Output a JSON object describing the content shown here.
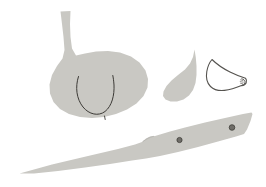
{
  "scene": {
    "title": "Garlic bulb, cloves and knife line drawing",
    "width": 266,
    "height": 187,
    "background_color": "#ffffff"
  },
  "palette": {
    "fill_gray": "#c9c8c3",
    "fill_gray_light": "#d3d2cd",
    "outline_gray": "#8c8b86",
    "detail_dark": "#3c3a36",
    "rivet_dark": "#4a4844",
    "background": "#ffffff"
  },
  "objects": [
    {
      "id": "garlic-bulb",
      "label": "Garlic bulb",
      "style": "filled-silhouette",
      "fill": "#c9c8c3",
      "path": "M 60.5 11.5 L 70.5 11.0 L 70.0 24.0 L 70.5 37.0 L 72.0 48.5 L 76.0 55.5 L 85.0 53.5 L 96.0 51.5 L 108.0 51.0 L 120.0 52.5 L 131.0 56.5 L 139.5 62.5 L 145.5 70.5 L 148.0 79.0 L 147.5 87.5 L 143.5 96.0 L 136.5 103.5 L 127.0 109.5 L 116.0 114.0 L 104.0 117.0 L 92.0 118.0 L 80.0 117.0 L 69.0 114.0 L 60.0 109.0 L 53.5 102.0 L 50.0 93.5 L 49.5 84.5 L 52.0 75.0 L 57.0 66.0 L 62.5 58.5 L 64.5 50.0 L 63.5 37.0 L 62.0 24.0 Z"
    },
    {
      "id": "garlic-bulb-cleft",
      "label": "Clove division line on bulb",
      "style": "detail-stroke",
      "stroke": "#3c3a36",
      "stroke_width": 1.0,
      "path": "M 78.5 76.5 C 75.0 87.0 76.5 99.0 83.0 107.0 C 89.0 114.5 98.5 116.5 105.0 111.5 C 112.0 106.0 114.5 95.0 114.0 85.0 C 113.7 80.5 113.2 77.5 112.8 75.5"
    },
    {
      "id": "garlic-bulb-root-tick",
      "label": "Root tick mark at bulb base",
      "style": "detail-stroke",
      "stroke": "#3c3a36",
      "stroke_width": 0.9,
      "path": "M 104.5 116.0 L 105.2 119.5"
    },
    {
      "id": "garlic-clove-filled",
      "label": "Single garlic clove, filled",
      "style": "filled-silhouette",
      "fill": "#c9c8c3",
      "path": "M 194.5 49.5 L 193.0 57.0 L 190.0 63.5 L 185.0 69.5 L 178.0 75.0 L 171.5 80.5 L 166.5 86.0 L 163.5 91.5 L 163.0 96.0 L 165.5 99.5 L 170.5 101.5 L 177.0 101.5 L 183.5 99.5 L 189.0 95.5 L 193.0 90.0 L 195.5 83.0 L 196.5 75.0 L 196.5 66.0 L 195.8 57.5 Z"
    },
    {
      "id": "garlic-clove-outline",
      "label": "Single garlic clove, outline only",
      "style": "outline-stroke",
      "stroke": "#55534f",
      "stroke_width": 1.1,
      "path": "M 212.0 59.5 C 216.5 64.0 223.0 68.5 230.0 72.0 C 236.5 75.3 242.5 77.2 245.5 78.2 C 246.5 79.5 246.8 81.2 246.2 82.8 C 245.5 84.5 243.8 85.5 241.5 85.6 C 237.0 87.5 230.5 89.8 224.5 90.4 C 218.0 91.0 213.5 89.5 210.5 86.5 C 207.0 83.0 205.8 77.5 206.8 71.5 C 207.8 66.0 209.8 62.0 212.0 59.5 Z"
    },
    {
      "id": "garlic-clove-outline-tip",
      "label": "Clove outline tip detail",
      "style": "detail-stroke",
      "stroke": "#55534f",
      "stroke_width": 1.0,
      "path": "M 241.8 78.8 C 243.5 79.2 244.8 80.2 245.0 81.6 C 245.2 83.2 244.2 84.6 242.3 85.2"
    },
    {
      "id": "garlic-clove-outline-hatch",
      "label": "Clove outline hatch marks",
      "style": "detail-stroke",
      "stroke": "#6e6c68",
      "stroke_width": 0.7,
      "path": "M 240.5 79.8 L 243.0 80.6 M 240.2 81.6 L 243.2 82.2 M 240.5 83.3 L 242.8 83.8"
    },
    {
      "id": "knife",
      "label": "Knife with blade and handle",
      "style": "filled-silhouette",
      "fill": "#c9c8c3",
      "path": "M 19.5 173.5 L 52.0 164.5 L 88.0 156.0 L 118.0 149.0 L 135.0 144.5 L 142.0 142.0 L 146.0 138.5 L 150.0 136.5 L 155.0 136.0 L 160.0 134.5 L 170.0 131.5 L 185.0 127.5 L 205.0 122.5 L 225.0 118.0 L 243.0 114.0 L 251.5 112.5 L 252.5 114.0 L 250.5 121.0 L 247.0 129.5 L 244.0 134.0 L 236.0 136.5 L 218.0 141.5 L 198.0 147.0 L 178.0 152.0 L 160.0 156.0 L 146.0 158.5 L 132.0 160.5 L 110.0 164.0 L 85.0 167.5 L 58.0 171.0 L 34.0 173.5 Z"
    },
    {
      "id": "knife-rivet-front",
      "label": "Front handle rivet",
      "style": "rivet",
      "fill": "#6f6d68",
      "stroke": "#3f3d39",
      "cx": 179.5,
      "cy": 140.0,
      "r": 2.6
    },
    {
      "id": "knife-rivet-back",
      "label": "Back handle rivet",
      "style": "rivet",
      "fill": "#6f6d68",
      "stroke": "#3f3d39",
      "cx": 232.0,
      "cy": 127.5,
      "r": 2.8
    },
    {
      "id": "knife-bolster-shadow",
      "label": "Bolster shading near handle junction",
      "style": "detail-stroke",
      "stroke": "#b9b8b3",
      "stroke_width": 1.0,
      "path": "M 143.0 141.5 C 146.5 139.0 149.5 137.2 153.5 136.4"
    }
  ],
  "caption": "Line illustration: garlic bulb, two cloves, and a long knife"
}
